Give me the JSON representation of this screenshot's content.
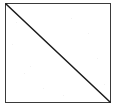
{
  "canvas": {
    "width": 119,
    "height": 109,
    "background_color": "#ffffff",
    "description": "Scanned geometric figure: a square with a diagonal from the top-left corner to the bottom-right corner, dividing it into two triangles."
  },
  "figure": {
    "name": "square-with-diagonal",
    "shape_label": "square",
    "stroke_color": "#3a3a3a",
    "diagonal_color": "#1a1a1a",
    "fill_color": "#ffffff",
    "stroke_width": 1.6,
    "diagonal_width": 1.5,
    "square": {
      "x": 5.5,
      "y": 3.5,
      "width": 105,
      "height": 99
    },
    "diagonal": {
      "from_corner": "top-left",
      "to_corner": "bottom-right",
      "x1": 6,
      "y1": 4,
      "x2": 110,
      "y2": 102
    }
  },
  "artifacts": {
    "label": "scan-noise",
    "color": "#f2f2f2",
    "specks": [
      {
        "x": 16,
        "y": 22
      },
      {
        "x": 71,
        "y": 18
      },
      {
        "x": 88,
        "y": 33
      },
      {
        "x": 30,
        "y": 66
      },
      {
        "x": 24,
        "y": 73
      },
      {
        "x": 97,
        "y": 58
      },
      {
        "x": 43,
        "y": 88
      },
      {
        "x": 63,
        "y": 95
      },
      {
        "x": 12,
        "y": 44
      },
      {
        "x": 104,
        "y": 84
      }
    ]
  }
}
